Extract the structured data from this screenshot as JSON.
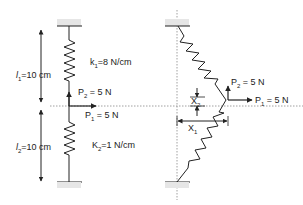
{
  "left_diagram": {
    "l1_label": "l",
    "l1_sub": "1",
    "l1_value": "=10 cm",
    "l2_label": "l",
    "l2_sub": "2",
    "l2_value": "=10 cm",
    "k1_label": "k",
    "k1_sub": "1",
    "k1_value": "=8 N/cm",
    "k2_label": "K",
    "k2_sub": "2",
    "k2_value": "=1 N/cm",
    "p2_label": "P",
    "p2_sub": "2",
    "p2_value": " = 5 N",
    "p1_label": "P",
    "p1_sub": "1",
    "p1_value": " = 5 N"
  },
  "right_diagram": {
    "p2_label": "P",
    "p2_sub": "2",
    "p2_value": " = 5 N",
    "p1_label": "P",
    "p1_sub": "1",
    "p1_value": " = 5 N",
    "x2_label": "X",
    "x2_sub": "2",
    "x1_label": "X",
    "x1_sub": "1"
  },
  "colors": {
    "line": "#222222",
    "dotted": "#888888",
    "support": "#cccccc"
  }
}
